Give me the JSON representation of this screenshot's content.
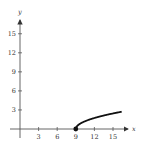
{
  "chart_data": {
    "type": "line",
    "title": "",
    "xlabel": "x",
    "ylabel": "y",
    "xlim": [
      -1,
      17
    ],
    "ylim": [
      -1,
      17
    ],
    "x_ticks": [
      3,
      6,
      9,
      12,
      15
    ],
    "y_ticks": [
      3,
      6,
      9,
      12,
      15
    ],
    "x_tick_labels": [
      "3",
      "6",
      "9",
      "12",
      "15"
    ],
    "y_tick_labels": [
      "3",
      "6",
      "9",
      "12",
      "15"
    ],
    "grid": false,
    "legend": null,
    "series": [
      {
        "name": "y = sqrt(x - 9)",
        "x": [
          9,
          9.25,
          9.5,
          10,
          10.5,
          11,
          12,
          13,
          14,
          15,
          16,
          16.4
        ],
        "values": [
          0,
          0.5,
          0.71,
          1,
          1.22,
          1.41,
          1.73,
          2,
          2.24,
          2.45,
          2.65,
          2.72
        ],
        "start_point": {
          "x": 9,
          "y": 0,
          "marker": "filled-dot"
        }
      }
    ]
  }
}
